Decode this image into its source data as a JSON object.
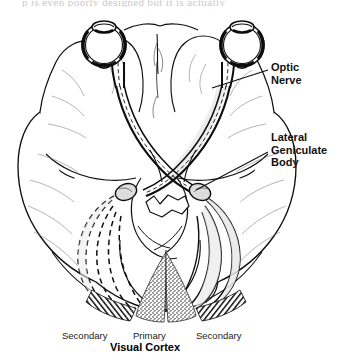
{
  "page": {
    "text_fragment": "p        is even poorly designed but it is actually"
  },
  "figure": {
    "callouts": [
      {
        "id": "optic-nerve",
        "label": "Optic\nNerve",
        "leader_from": [
          265,
          70
        ],
        "leader_to": [
          212,
          88
        ]
      },
      {
        "id": "lateral-geniculate-body",
        "label": "Lateral\nGeniculate\nBody",
        "leader_from": [
          265,
          152
        ],
        "leader_to": [
          196,
          190
        ]
      }
    ],
    "cortex_labels": {
      "secondary_left": "Secondary",
      "primary": "Primary",
      "secondary_right": "Secondary",
      "region_title": "Visual Cortex"
    },
    "structures": [
      "eyeball-left",
      "eyeball-right",
      "optic-nerve-left",
      "optic-nerve-right",
      "optic-chiasm",
      "optic-tract-left",
      "optic-tract-right",
      "lateral-geniculate-body-left",
      "lateral-geniculate-body-right",
      "optic-radiation-left-dashed",
      "optic-radiation-right-solid",
      "primary-visual-cortex-stippled",
      "secondary-visual-cortex-hatched",
      "frontal-lobe",
      "temporal-lobe",
      "occipital-lobe",
      "brainstem",
      "cerebellum",
      "longitudinal-fissure"
    ],
    "colors": {
      "ink": "#111111",
      "paper": "#ffffff",
      "tract_fill": "#e9e9e9",
      "faint_text": "#c9c9c9"
    }
  }
}
